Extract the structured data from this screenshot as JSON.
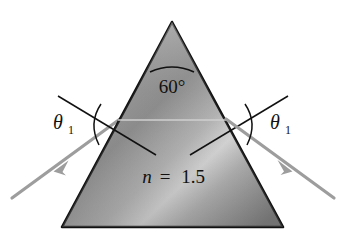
{
  "figure": {
    "background_color": "#ffffff",
    "prism": {
      "shape": "equilateral-triangle",
      "apex_angle_label": "60°",
      "apex_angle_degrees": 60,
      "index_label_symbol": "n",
      "index_label_equals": "=",
      "index_label_value": "1.5",
      "outline_color": "#111111",
      "fill_light": "#d8d8d8",
      "fill_mid": "#9a9a9a",
      "fill_dark": "#6f6f6f",
      "vertices": {
        "apex": [
          172,
          22
        ],
        "bottom_left": [
          62,
          227
        ],
        "bottom_right": [
          283,
          227
        ]
      }
    },
    "rays": {
      "color": "#9d9d9d",
      "incident": {
        "name": "incident-ray",
        "from": [
          12,
          198
        ],
        "to": [
          118,
          120
        ],
        "arrow_direction": "up-right"
      },
      "emergent": {
        "name": "emergent-ray",
        "from": [
          227,
          120
        ],
        "to": [
          334,
          198
        ],
        "arrow_direction": "down-right"
      }
    },
    "normals": {
      "color": "#111111",
      "left_extension": {
        "name": "left-normal-extension",
        "from": [
          58,
          97
        ],
        "to": [
          155,
          154
        ]
      },
      "right_extension": {
        "name": "right-normal-extension",
        "from": [
          287,
          97
        ],
        "to": [
          190,
          154
        ]
      },
      "interior_normal": {
        "name": "interior-normal-line",
        "from": [
          118,
          120
        ],
        "to": [
          227,
          120
        ],
        "color": "#c9c9c9"
      }
    },
    "angles": {
      "left": {
        "name": "theta-left",
        "symbol": "θ",
        "subscript": "1"
      },
      "right": {
        "name": "theta-right",
        "symbol": "θ",
        "subscript": "1"
      }
    }
  }
}
